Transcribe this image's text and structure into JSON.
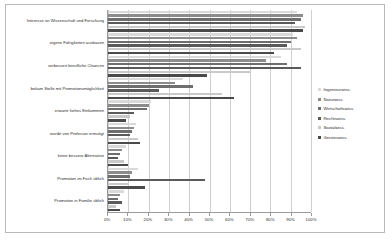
{
  "chart_data": {
    "type": "bar",
    "orientation": "horizontal",
    "title": "",
    "xlabel": "",
    "ylabel": "",
    "xlim": [
      0,
      100
    ],
    "grid": true,
    "legend_position": "right",
    "tick_labels": [
      "0%",
      "10%",
      "20%",
      "30%",
      "40%",
      "50%",
      "60%",
      "70%",
      "80%",
      "90%",
      "100%"
    ],
    "tick_values": [
      0,
      10,
      20,
      30,
      40,
      50,
      60,
      70,
      80,
      90,
      100
    ],
    "categories": [
      "Interesse an Wissenschaft und Forschung",
      "eigene Fähigkeiten ausbauen",
      "verbessert berufliche Chancen",
      "bekam Stelle mit Promotionsmöglichkeit",
      "erwarte hohes Einkommen",
      "wurde von Professor ermutigt",
      "keine bessere Alternative",
      "Promotion im Fach üblich",
      "Promotion in Familie üblich"
    ],
    "series": [
      {
        "name": "Ingenieurwiss.",
        "color": "#d9d9d9",
        "values": [
          93,
          91,
          85,
          37,
          21,
          14,
          9,
          15,
          8
        ]
      },
      {
        "name": "Naturwiss.",
        "color": "#8c8c8c",
        "values": [
          96,
          93,
          78,
          33,
          20,
          13,
          7,
          12,
          6
        ]
      },
      {
        "name": "Wirtschaftswiss.",
        "color": "#6e6e6e",
        "values": [
          95,
          90,
          88,
          42,
          19,
          12,
          6,
          11,
          5
        ]
      },
      {
        "name": "Rechtswiss.",
        "color": "#5a5a5a",
        "values": [
          92,
          88,
          95,
          25,
          13,
          11,
          5,
          48,
          7
        ]
      },
      {
        "name": "Sozialwiss.",
        "color": "#c9c9c9",
        "values": [
          97,
          95,
          70,
          56,
          11,
          15,
          8,
          10,
          4
        ]
      },
      {
        "name": "Geisteswiss.",
        "color": "#4a4a4a",
        "values": [
          96,
          82,
          49,
          62,
          9,
          16,
          10,
          18,
          6
        ]
      }
    ]
  }
}
